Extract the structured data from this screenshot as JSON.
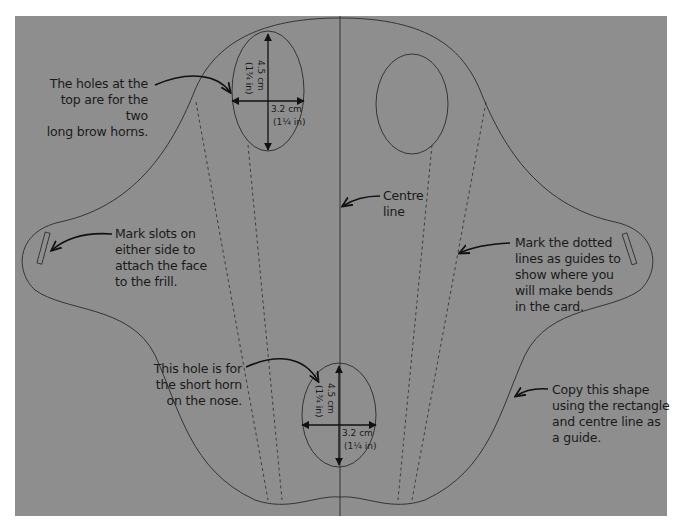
{
  "diagram": {
    "colors": {
      "background": "#8e8e8e",
      "page": "#ffffff",
      "line": "#2a2a2a",
      "text": "#1a1a1a"
    },
    "annotations": {
      "brow_horns": "The holes at the top are for the two long brow horns.",
      "brow_horns_lines": [
        "The holes at the",
        "top are for the two",
        "long brow horns."
      ],
      "slots_lines": [
        "Mark slots on",
        "either side to",
        "attach the face",
        "to the frill."
      ],
      "centre_lines": [
        "Centre",
        "line"
      ],
      "dotted_lines": [
        "Mark the dotted",
        "lines as guides to",
        "show where you",
        "will make bends",
        "in the card."
      ],
      "nose_horn_lines": [
        "This hole is for",
        "the short horn",
        "on the nose."
      ],
      "copy_shape_lines": [
        "Copy this shape",
        "using the rectangle",
        "and centre line as",
        "a guide."
      ]
    },
    "dimensions": {
      "top_hole": {
        "height_cm": "4.5 cm",
        "height_in": "(1¾ in)",
        "width_cm": "3.2 cm",
        "width_in": "(1¼ in)"
      },
      "nose_hole": {
        "height_cm": "4.5 cm",
        "height_in": "(1¾ in)",
        "width_cm": "3.2 cm",
        "width_in": "(1¼ in)"
      }
    }
  }
}
